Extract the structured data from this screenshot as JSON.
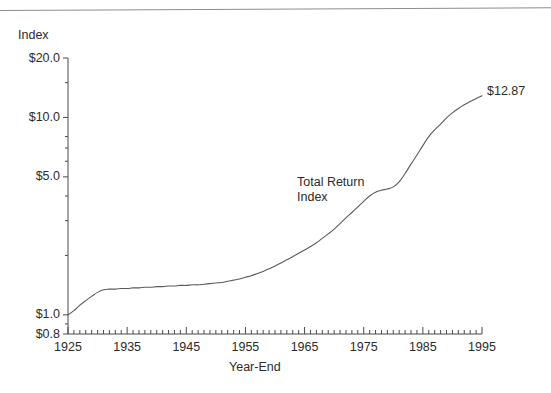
{
  "figure": {
    "has_top_rule": true,
    "background_color": "#ffffff",
    "line_color": "#5a5a5a",
    "text_color": "#2b2b2b",
    "axis_color": "#4a4a4a"
  },
  "chart_data": {
    "type": "line",
    "title": "",
    "subtitle": "",
    "xlabel": "Year-End",
    "ylabel": "Index",
    "yscale": "log",
    "xscale": "linear",
    "grid": false,
    "legend": "none",
    "xlim": [
      1925,
      1995
    ],
    "ylim": [
      0.8,
      20.0
    ],
    "ytick_labels": [
      "$20.0",
      "$10.0",
      "$5.0",
      "$1.0",
      "$0.8"
    ],
    "ytick_values": [
      20.0,
      10.0,
      5.0,
      1.0,
      0.8
    ],
    "yminor_tick_values": [
      15.0,
      8.0,
      7.0,
      6.0,
      4.0,
      3.0,
      2.0,
      0.9
    ],
    "xtick_labels": [
      "1925",
      "1935",
      "1945",
      "1955",
      "1965",
      "1975",
      "1985",
      "1995"
    ],
    "xtick_values": [
      1925,
      1935,
      1945,
      1955,
      1965,
      1975,
      1985,
      1995
    ],
    "xminor_tick_step": 1,
    "annotations": [
      {
        "name": "series-annotation",
        "lines": [
          "Total Return",
          "Index"
        ],
        "x": 1964,
        "y": 3.1
      },
      {
        "name": "endpoint-value",
        "text": "$12.87",
        "x": 1995,
        "y": 12.87
      }
    ],
    "series": [
      {
        "name": "Total Return Index",
        "endpoint_value": 12.87,
        "x": [
          1925,
          1926,
          1927,
          1928,
          1929,
          1930,
          1931,
          1932,
          1933,
          1934,
          1935,
          1936,
          1937,
          1938,
          1939,
          1940,
          1941,
          1942,
          1943,
          1944,
          1945,
          1946,
          1947,
          1948,
          1949,
          1950,
          1951,
          1952,
          1953,
          1954,
          1955,
          1956,
          1957,
          1958,
          1959,
          1960,
          1961,
          1962,
          1963,
          1964,
          1965,
          1966,
          1967,
          1968,
          1969,
          1970,
          1971,
          1972,
          1973,
          1974,
          1975,
          1976,
          1977,
          1978,
          1979,
          1980,
          1981,
          1982,
          1983,
          1984,
          1985,
          1986,
          1987,
          1988,
          1989,
          1990,
          1991,
          1992,
          1993,
          1994,
          1995
        ],
        "values": [
          1.0,
          1.05,
          1.12,
          1.18,
          1.24,
          1.3,
          1.34,
          1.35,
          1.35,
          1.36,
          1.36,
          1.37,
          1.37,
          1.38,
          1.38,
          1.39,
          1.39,
          1.4,
          1.4,
          1.41,
          1.41,
          1.42,
          1.42,
          1.43,
          1.44,
          1.45,
          1.46,
          1.48,
          1.5,
          1.52,
          1.55,
          1.58,
          1.62,
          1.66,
          1.71,
          1.77,
          1.83,
          1.9,
          1.97,
          2.05,
          2.13,
          2.22,
          2.32,
          2.44,
          2.57,
          2.72,
          2.9,
          3.1,
          3.3,
          3.52,
          3.76,
          4.0,
          4.18,
          4.28,
          4.34,
          4.45,
          4.72,
          5.2,
          5.8,
          6.45,
          7.2,
          8.0,
          8.65,
          9.25,
          9.95,
          10.55,
          11.1,
          11.6,
          12.05,
          12.45,
          12.87
        ]
      }
    ]
  }
}
